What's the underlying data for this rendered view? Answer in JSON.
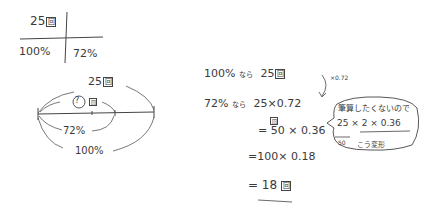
{
  "table": {
    "top_left": "25",
    "top_left_unit": "回",
    "bottom_left": "100%",
    "bottom_right": "72%"
  },
  "number_line": {
    "top_label": "25",
    "top_unit": "回",
    "unknown_label": "?",
    "unknown_unit": "回",
    "percent_inner": "72%",
    "percent_outer": "100%"
  },
  "calculation": {
    "line1": {
      "left": "100%",
      "connector": "なら",
      "value": "25",
      "unit": "回"
    },
    "line2": {
      "left": "72%",
      "connector": "なら",
      "value": "25×0.72",
      "unit": "回"
    },
    "line3": "= 50 × 0.36",
    "line4": "=100× 0.18",
    "line5": {
      "value": "= 18",
      "unit": "回"
    },
    "arrow_note": "×0.72"
  },
  "bubble": {
    "title": "筆算したくないので",
    "expr": "25 × 2 × 0.36",
    "under": "50",
    "note": "こう変形"
  }
}
